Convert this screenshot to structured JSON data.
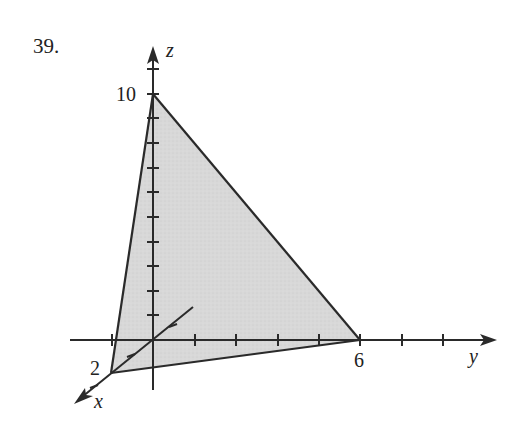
{
  "problem_number": "39.",
  "axes": {
    "z_label": "z",
    "y_label": "y",
    "x_label": "x"
  },
  "intercepts": {
    "z": "10",
    "y": "6",
    "x": "2"
  },
  "colors": {
    "fill": "#d6d6d6",
    "stroke": "#2a2a2a"
  },
  "diagram": {
    "type": "3D plane intercept triangle",
    "vertices": [
      {
        "axis": "x",
        "value": 2
      },
      {
        "axis": "y",
        "value": 6
      },
      {
        "axis": "z",
        "value": 10
      }
    ],
    "z_ticks": 11,
    "y_ticks": [
      -1,
      1,
      2,
      3,
      4,
      5,
      6,
      7,
      8
    ]
  }
}
